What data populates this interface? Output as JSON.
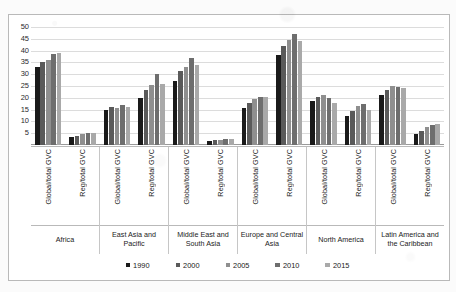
{
  "chart_data": {
    "type": "bar",
    "title": "",
    "xlabel": "",
    "ylabel": "",
    "ylim": [
      0,
      50
    ],
    "ytick_labels": [
      "50",
      "45",
      "40",
      "35",
      "30",
      "25",
      "20",
      "15",
      "10",
      "5"
    ],
    "ytick_values": [
      50,
      45,
      40,
      35,
      30,
      25,
      20,
      15,
      10,
      5
    ],
    "grid": true,
    "legend_position": "bottom",
    "legend": [
      "1990",
      "2000",
      "2005",
      "2010",
      "2015"
    ],
    "series_colors": [
      "#1a1a1a",
      "#5a5a5a",
      "#8f8f8f",
      "#6e6e6e",
      "#a9a9a9"
    ],
    "measure_labels": [
      "Global/total GVC",
      "Reg/total GVC"
    ],
    "regions": [
      "Africa",
      "East Asia and Pacific",
      "Middle East and South Asia",
      "Europe and Central Asia",
      "North America",
      "Latin America and the Caribbean"
    ],
    "categories": [
      "Africa Global/total GVC",
      "Africa Reg/total GVC",
      "East Asia and Pacific Global/total GVC",
      "East Asia and Pacific Reg/total GVC",
      "Middle East and South Asia Global/total GVC",
      "Middle East and South Asia Reg/total GVC",
      "Europe and Central Asia Global/total GVC",
      "Europe and Central Asia Reg/total GVC",
      "North America Global/total GVC",
      "North America Reg/total GVC",
      "Latin America and the Caribbean Global/total GVC",
      "Latin America and the Caribbean Reg/total GVC"
    ],
    "series": [
      {
        "name": "1990",
        "values": [
          33.0,
          3.5,
          15.0,
          20.0,
          27.0,
          1.8,
          15.5,
          38.0,
          18.5,
          12.5,
          21.0,
          4.5
        ]
      },
      {
        "name": "2000",
        "values": [
          35.0,
          4.0,
          16.0,
          23.5,
          31.5,
          2.0,
          18.0,
          42.0,
          20.5,
          14.5,
          23.5,
          6.0
        ]
      },
      {
        "name": "2005",
        "values": [
          36.0,
          4.5,
          15.5,
          25.5,
          33.0,
          2.2,
          19.5,
          44.5,
          21.0,
          16.5,
          25.0,
          7.5
        ]
      },
      {
        "name": "2010",
        "values": [
          38.5,
          5.0,
          17.0,
          30.0,
          37.0,
          2.4,
          20.5,
          47.0,
          20.0,
          17.5,
          24.5,
          8.5
        ]
      },
      {
        "name": "2015",
        "values": [
          39.0,
          5.0,
          16.0,
          26.0,
          34.0,
          2.4,
          20.5,
          44.0,
          18.0,
          15.0,
          24.0,
          9.0
        ]
      }
    ]
  }
}
